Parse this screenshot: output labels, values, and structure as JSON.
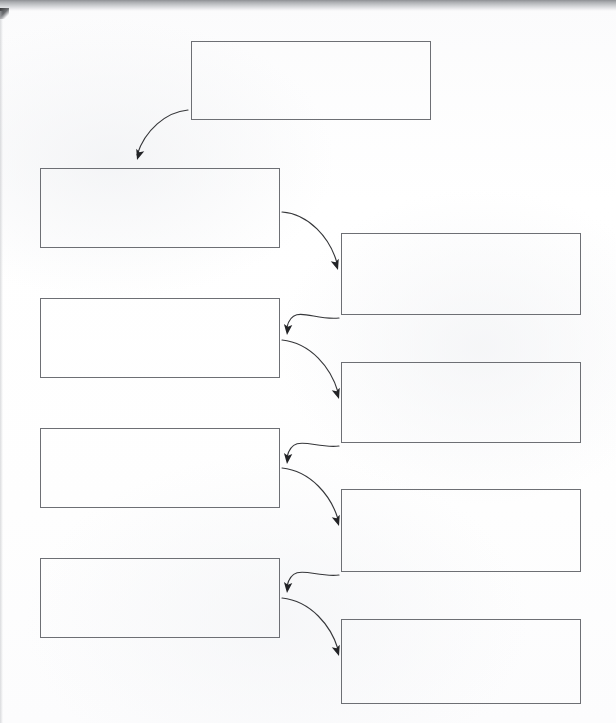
{
  "document": {
    "type": "flowchart",
    "title": "",
    "description": "Blank scanned flowchart worksheet with nine empty rectangular boxes connected by curved arrows",
    "page_width": 616,
    "page_height": 723,
    "background_color": "#fdfdfd",
    "box_border_color": "#6d6f74",
    "arrow_color": "#36373a",
    "scan_edge_color": "#8e9094"
  },
  "boxes": [
    {
      "id": "box-top",
      "label": "",
      "column": "center",
      "index": 0,
      "x": 191,
      "y": 41,
      "w": 240,
      "h": 79
    },
    {
      "id": "box-left-1",
      "label": "",
      "column": "left",
      "index": 1,
      "x": 40,
      "y": 168,
      "w": 240,
      "h": 80
    },
    {
      "id": "box-right-1",
      "label": "",
      "column": "right",
      "index": 2,
      "x": 341,
      "y": 233,
      "w": 240,
      "h": 82
    },
    {
      "id": "box-left-2",
      "label": "",
      "column": "left",
      "index": 3,
      "x": 40,
      "y": 298,
      "w": 240,
      "h": 80
    },
    {
      "id": "box-right-2",
      "label": "",
      "column": "right",
      "index": 4,
      "x": 341,
      "y": 362,
      "w": 240,
      "h": 81
    },
    {
      "id": "box-left-3",
      "label": "",
      "column": "left",
      "index": 5,
      "x": 40,
      "y": 428,
      "w": 240,
      "h": 80
    },
    {
      "id": "box-right-3",
      "label": "",
      "column": "right",
      "index": 6,
      "x": 341,
      "y": 489,
      "w": 240,
      "h": 83
    },
    {
      "id": "box-left-4",
      "label": "",
      "column": "left",
      "index": 7,
      "x": 40,
      "y": 558,
      "w": 240,
      "h": 80
    },
    {
      "id": "box-right-4",
      "label": "",
      "column": "right",
      "index": 8,
      "x": 341,
      "y": 619,
      "w": 240,
      "h": 85
    }
  ],
  "arrows": [
    {
      "id": "arrow-top-to-left-1",
      "from": "box-top",
      "to": "box-left-1",
      "path": "M 188 110 C 166 112 145 130 137 155",
      "head_x": 137,
      "head_y": 160,
      "head_angle": 108
    },
    {
      "id": "arrow-left-1-to-right-1",
      "from": "box-left-1",
      "to": "box-right-1",
      "path": "M 282 212 C 309 214 330 238 337 263",
      "head_x": 338,
      "head_y": 270,
      "head_angle": 72
    },
    {
      "id": "arrow-right-1-to-left-2",
      "from": "box-right-1",
      "to": "box-left-2",
      "path": "M 339 318 C 313 321 293 303 287 327",
      "head_x": 287,
      "head_y": 335,
      "head_angle": 96
    },
    {
      "id": "arrow-left-2-to-right-2",
      "from": "box-left-2",
      "to": "box-right-2",
      "path": "M 282 340 C 311 343 331 368 338 392",
      "head_x": 339,
      "head_y": 399,
      "head_angle": 72
    },
    {
      "id": "arrow-right-2-to-left-3",
      "from": "box-right-2",
      "to": "box-left-3",
      "path": "M 339 446 C 313 449 293 432 287 457",
      "head_x": 287,
      "head_y": 464,
      "head_angle": 96
    },
    {
      "id": "arrow-left-3-to-right-3",
      "from": "box-left-3",
      "to": "box-right-3",
      "path": "M 282 468 C 311 471 331 496 338 519",
      "head_x": 339,
      "head_y": 526,
      "head_angle": 72
    },
    {
      "id": "arrow-right-3-to-left-4",
      "from": "box-right-3",
      "to": "box-left-4",
      "path": "M 339 575 C 313 578 293 561 287 586",
      "head_x": 287,
      "head_y": 593,
      "head_angle": 96
    },
    {
      "id": "arrow-left-4-to-right-4",
      "from": "box-left-4",
      "to": "box-right-4",
      "path": "M 282 598 C 311 601 331 626 338 649",
      "head_x": 339,
      "head_y": 656,
      "head_angle": 72
    }
  ]
}
